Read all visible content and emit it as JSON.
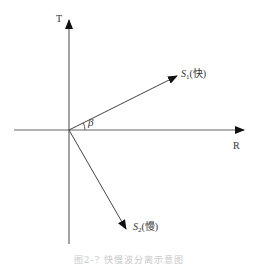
{
  "diagram": {
    "axes": {
      "vertical_label": "T",
      "horizontal_label": "R"
    },
    "vectors": [
      {
        "id": "S1",
        "symbol": "S",
        "subscript": "1",
        "suffix": "(快)",
        "meaning": "fast"
      },
      {
        "id": "S2",
        "symbol": "S",
        "subscript": "2",
        "suffix": "(慢)",
        "meaning": "slow"
      }
    ],
    "angle_label": "β",
    "caption": "图2-?  快慢波分离示意图",
    "colors": {
      "axis": "#555555",
      "arrow": "#111111",
      "text": "#333333",
      "caption": "#c9c9c9"
    }
  }
}
